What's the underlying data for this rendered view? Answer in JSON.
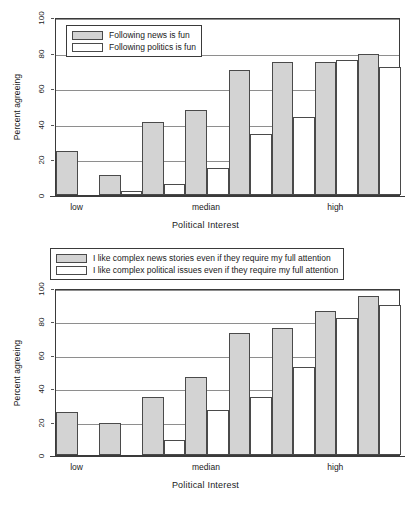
{
  "chart_data": [
    {
      "id": "chart-top",
      "type": "bar",
      "title": "",
      "xlabel": "Political Interest",
      "ylabel": "Percent agreeing",
      "ylim": [
        0,
        100
      ],
      "yticks": [
        0,
        20,
        40,
        60,
        80,
        100
      ],
      "grid": true,
      "legend_position": "top-left-inside",
      "categories": [
        "1",
        "2",
        "3",
        "4",
        "5",
        "6",
        "7"
      ],
      "xtick_labels": [
        "low",
        "median",
        "high"
      ],
      "xtick_positions": [
        1,
        4,
        7
      ],
      "series": [
        {
          "name": "Following news is fun",
          "color": "#d3d3d3",
          "values": [
            25,
            11,
            41,
            48,
            70,
            75,
            75,
            79
          ]
        },
        {
          "name": "Following politics is fun",
          "color": "#ffffff",
          "values": [
            0,
            2,
            6,
            15,
            34,
            44,
            76,
            72
          ]
        }
      ]
    },
    {
      "id": "chart-bottom",
      "type": "bar",
      "title": "",
      "xlabel": "Political Interest",
      "ylabel": "Percent agreeing",
      "ylim": [
        0,
        100
      ],
      "yticks": [
        0,
        20,
        40,
        60,
        80,
        100
      ],
      "grid": true,
      "legend_position": "above-plot",
      "categories": [
        "1",
        "2",
        "3",
        "4",
        "5",
        "6",
        "7"
      ],
      "xtick_labels": [
        "low",
        "median",
        "high"
      ],
      "xtick_positions": [
        1,
        4,
        7
      ],
      "series": [
        {
          "name": "I like complex news stories even if they require my full attention",
          "color": "#d3d3d3",
          "values": [
            26,
            19,
            35,
            47,
            73,
            76,
            86,
            95
          ]
        },
        {
          "name": "I like complex political issues even if they require my full attention",
          "color": "#ffffff",
          "values": [
            0,
            0,
            9,
            27,
            35,
            53,
            82,
            90
          ]
        }
      ]
    }
  ],
  "colors": {
    "series_gray": "#d3d3d3",
    "series_white": "#ffffff",
    "bar_border": "#4a4a4a",
    "grid": "#8e8e8e",
    "axis": "#3a3a3a",
    "text": "#1a1a1a"
  }
}
